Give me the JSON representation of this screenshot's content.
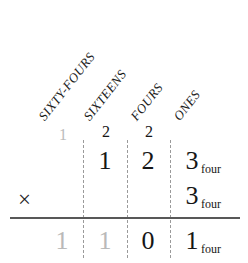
{
  "figure": {
    "type": "base-four-multiplication-worked-example",
    "base_name": "four",
    "operator": "×"
  },
  "colors": {
    "ink": "#161616",
    "faint_ink": "#b9b9b9",
    "dashed_rule": "#9a9a9a",
    "sum_rule": "#585858",
    "background": "#ffffff"
  },
  "column_labels": [
    {
      "text": "SIXTY-FOURS",
      "place_value": 64
    },
    {
      "text": "SIXTEENS",
      "place_value": 16
    },
    {
      "text": "FOURS",
      "place_value": 4
    },
    {
      "text": "ONES",
      "place_value": 1
    }
  ],
  "carry_row": [
    {
      "text": "1",
      "faint": true
    },
    {
      "text": "2",
      "faint": false
    },
    {
      "text": "2",
      "faint": false
    },
    {
      "text": "",
      "faint": false
    }
  ],
  "multiplicand_row": {
    "digits": [
      {
        "text": "",
        "faint": false
      },
      {
        "text": "1",
        "faint": false
      },
      {
        "text": "2",
        "faint": false
      },
      {
        "text": "3",
        "faint": false
      }
    ],
    "subscript": "four"
  },
  "multiplier_row": {
    "operator": "×",
    "digits": [
      {
        "text": "",
        "faint": false
      },
      {
        "text": "",
        "faint": false
      },
      {
        "text": "",
        "faint": false
      },
      {
        "text": "3",
        "faint": false
      }
    ],
    "subscript": "four"
  },
  "product_row": {
    "digits": [
      {
        "text": "1",
        "faint": true
      },
      {
        "text": "1",
        "faint": true
      },
      {
        "text": "0",
        "faint": false
      },
      {
        "text": "1",
        "faint": false
      }
    ],
    "subscript": "four"
  }
}
